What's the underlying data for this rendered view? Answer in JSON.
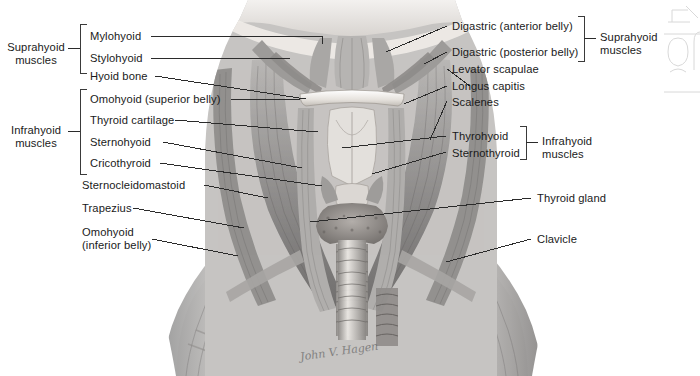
{
  "figure": {
    "signature": "John V. Hagen",
    "background_color": "#ffffff",
    "ink_color": "#1a1a1a",
    "leader_color": "#2b2b2b"
  },
  "left_groups": [
    {
      "name": "suprahyoid-group",
      "label": "Suprahyoid\nmuscles"
    },
    {
      "name": "infrahyoid-group",
      "label": "Infrahyoid\nmuscles"
    }
  ],
  "right_groups": [
    {
      "name": "suprahyoid-group-right",
      "label": "Suprahyoid\nmuscles"
    },
    {
      "name": "infrahyoid-group-right",
      "label": "Infrahyoid\nmuscles"
    }
  ],
  "left_labels": [
    {
      "name": "mylohyoid",
      "text": "Mylohyoid"
    },
    {
      "name": "stylohyoid",
      "text": "Stylohyoid"
    },
    {
      "name": "hyoid-bone",
      "text": "Hyoid bone"
    },
    {
      "name": "omohyoid-superior",
      "text": "Omohyoid (superior belly)"
    },
    {
      "name": "thyroid-cartilage",
      "text": "Thyroid cartilage"
    },
    {
      "name": "sternohyoid",
      "text": "Sternohyoid"
    },
    {
      "name": "cricothyroid",
      "text": "Cricothyroid"
    },
    {
      "name": "sternocleidomastoid",
      "text": "Sternocleidomastoid"
    },
    {
      "name": "trapezius",
      "text": "Trapezius"
    },
    {
      "name": "omohyoid-inferior",
      "text": "Omohyoid\n(inferior belly)"
    }
  ],
  "right_labels": [
    {
      "name": "digastric-anterior",
      "text": "Digastric (anterior belly)"
    },
    {
      "name": "digastric-posterior",
      "text": "Digastric (posterior belly)"
    },
    {
      "name": "levator-scapulae",
      "text": "Levator scapulae"
    },
    {
      "name": "longus-capitis",
      "text": "Longus capitis"
    },
    {
      "name": "scalenes",
      "text": "Scalenes"
    },
    {
      "name": "thyrohyoid",
      "text": "Thyrohyoid"
    },
    {
      "name": "sternothyroid",
      "text": "Sternothyroid"
    },
    {
      "name": "thyroid-gland",
      "text": "Thyroid gland"
    },
    {
      "name": "clavicle",
      "text": "Clavicle"
    }
  ]
}
